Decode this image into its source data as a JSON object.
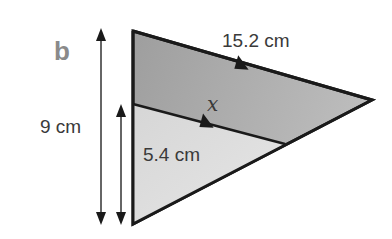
{
  "diagram": {
    "part_label": "b",
    "labels": {
      "top_side": "15.2 cm",
      "outer_height": "9 cm",
      "inner_height": "5.4 cm",
      "unknown_side": "x"
    },
    "colors": {
      "large_triangle_fill": "#a9a9a9",
      "small_triangle_fill": "#dcdcdc",
      "stroke": "#1a1a1a",
      "part_label": "#8a8a8a"
    }
  }
}
